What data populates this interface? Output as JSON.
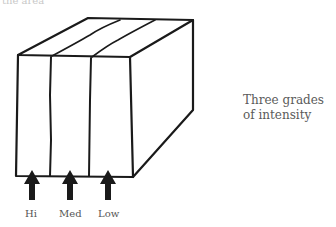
{
  "figure": {
    "top_cut_text": "the area",
    "caption_line1": "Three grades",
    "caption_line2": "of intensity",
    "labels": [
      "Hi",
      "Med",
      "Low"
    ],
    "stroke_color": "#1a1a1a"
  }
}
